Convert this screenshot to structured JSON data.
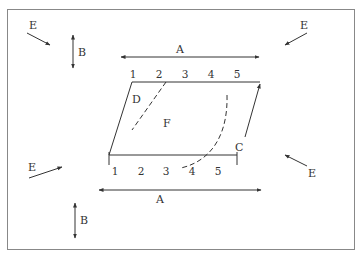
{
  "diagram": {
    "labels": {
      "A": "A",
      "B": "B",
      "C": "C",
      "D": "D",
      "E": "E",
      "F": "F"
    },
    "top_numbers": [
      "1",
      "2",
      "3",
      "4",
      "5"
    ],
    "bottom_numbers": [
      "1",
      "2",
      "3",
      "4",
      "5"
    ],
    "colors": {
      "stroke": "#333333",
      "border": "#888888",
      "background": "#ffffff"
    }
  }
}
